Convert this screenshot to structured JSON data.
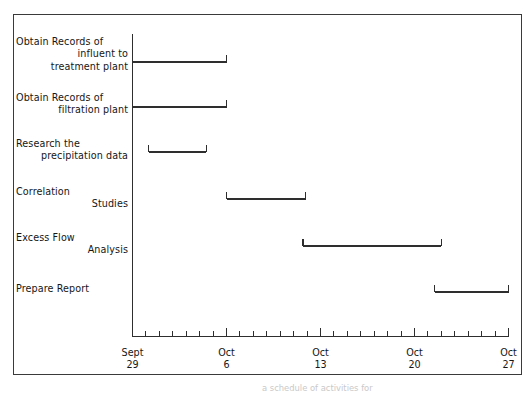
{
  "figure": {
    "frame": {
      "x": 13,
      "y": 14,
      "width": 509,
      "height": 361
    },
    "caption_bleed": "a schedule of activities for"
  },
  "chart_data": {
    "type": "bar",
    "orientation": "horizontal",
    "subtype": "gantt",
    "title": "",
    "xlabel": "",
    "ylabel": "",
    "grid": false,
    "legend": false,
    "x_axis": {
      "type": "date",
      "range": [
        "Sept 29",
        "Oct 27"
      ],
      "total_days": 28,
      "minor_tick_unit_days": 1,
      "major_tick_interval_days": 7,
      "major_ticks": [
        {
          "month": "Sept",
          "day": "29",
          "offset_days": 0
        },
        {
          "month": "Oct",
          "day": "6",
          "offset_days": 7
        },
        {
          "month": "Oct",
          "day": "13",
          "offset_days": 14
        },
        {
          "month": "Oct",
          "day": "20",
          "offset_days": 21
        },
        {
          "month": "Oct",
          "day": "27",
          "offset_days": 28
        }
      ]
    },
    "categories": [
      "Obtain Records of influent to treatment plant",
      "Obtain Records of filtration plant",
      "Research the precipitation data",
      "Correlation Studies",
      "Excess Flow Analysis",
      "Prepare Report"
    ],
    "tasks": [
      {
        "lines": [
          "Obtain Records of",
          "influent to",
          "treatment plant"
        ],
        "start_day": 0,
        "end_day": 7,
        "start_label": "Sept 29",
        "end_label": "Oct 6",
        "duration_days": 7
      },
      {
        "lines": [
          "Obtain Records of",
          "filtration plant"
        ],
        "start_day": 0,
        "end_day": 7,
        "start_label": "Sept 29",
        "end_label": "Oct 6",
        "duration_days": 7
      },
      {
        "lines": [
          "Research the",
          "precipitation data"
        ],
        "start_day": 1.2,
        "end_day": 5.5,
        "start_label": "Sept 30",
        "end_label": "Oct 4",
        "duration_days": 4.3
      },
      {
        "lines": [
          "Correlation",
          "Studies"
        ],
        "start_day": 7,
        "end_day": 12.9,
        "start_label": "Oct 6",
        "end_label": "Oct 12",
        "duration_days": 5.9
      },
      {
        "lines": [
          "Excess Flow",
          "Analysis"
        ],
        "start_day": 12.7,
        "end_day": 23,
        "start_label": "Oct 12",
        "end_label": "Oct 22",
        "duration_days": 10.3
      },
      {
        "lines": [
          "Prepare Report"
        ],
        "start_day": 22.5,
        "end_day": 28,
        "start_label": "Oct 21",
        "end_label": "Oct 27",
        "duration_days": 5.5
      }
    ],
    "colors": {
      "axis": "#2e2e2e",
      "bar": "#2e2e2e",
      "frame": "#3a3a3a",
      "text": "#161616",
      "background": "#ffffff"
    }
  }
}
